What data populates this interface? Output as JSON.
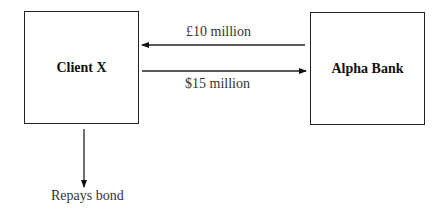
{
  "nodes": {
    "client": {
      "label": "Client X"
    },
    "bank": {
      "label": "Alpha Bank"
    }
  },
  "edges": {
    "bank_to_client": {
      "label": "£10 million",
      "from": "Alpha Bank",
      "to": "Client X"
    },
    "client_to_bank": {
      "label": "$15 million",
      "from": "Client X",
      "to": "Alpha Bank"
    },
    "client_out": {
      "label": "Repays bond",
      "from": "Client X"
    }
  },
  "colors": {
    "stroke": "#222222",
    "text": "#333333"
  }
}
